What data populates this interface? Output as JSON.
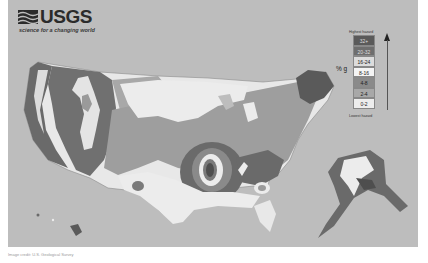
{
  "brand": {
    "wordmark": "USGS",
    "tagline": "science for a changing world"
  },
  "map": {
    "title": "Seismic hazard map",
    "regions": [
      "Conterminous United States",
      "Alaska",
      "Hawaii"
    ],
    "colors": {
      "background": "#bdbdbd",
      "lowest": "#ececec",
      "low": "#dcdcdc",
      "mid": "#9a9a9a",
      "high": "#6e6e6e",
      "highest": "#4a4a4a"
    }
  },
  "legend": {
    "top_caption": "Highest hazard",
    "bottom_caption": "Lowest hazard",
    "unit_label": "% g",
    "bins": [
      {
        "label": "32+",
        "color": "#5a5a5a"
      },
      {
        "label": "20-32",
        "color": "#6e6e6e"
      },
      {
        "label": "16-24",
        "color": "#dcdcdc"
      },
      {
        "label": "8-16",
        "color": "#f4f4f4"
      },
      {
        "label": "4-8",
        "color": "#8a8a8a"
      },
      {
        "label": "2-4",
        "color": "#a8a8a8"
      },
      {
        "label": "0-2",
        "color": "#ededed"
      }
    ]
  },
  "caption": "Image credit: U.S. Geological Survey"
}
